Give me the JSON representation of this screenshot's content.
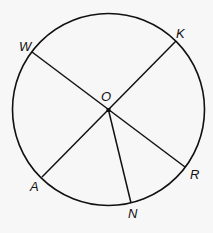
{
  "diagram": {
    "type": "circle-with-radii",
    "center": {
      "label": "O",
      "x": 108.5,
      "y": 110
    },
    "radius": 96,
    "stroke_color": "#111111",
    "background": "#f7f7f7",
    "points": [
      {
        "label": "W",
        "x": 32,
        "y": 52,
        "label_x": 20,
        "label_y": 50
      },
      {
        "label": "K",
        "x": 176,
        "y": 41,
        "label_x": 177,
        "label_y": 38
      },
      {
        "label": "R",
        "x": 185,
        "y": 167,
        "label_x": 190,
        "label_y": 179
      },
      {
        "label": "N",
        "x": 131,
        "y": 203,
        "label_x": 127,
        "label_y": 218
      },
      {
        "label": "A",
        "x": 42,
        "y": 177,
        "label_x": 30,
        "label_y": 191
      }
    ],
    "segments": [
      {
        "name": "diameter-WR",
        "from": "W",
        "to": "R"
      },
      {
        "name": "diameter-KA",
        "from": "K",
        "to": "A"
      },
      {
        "name": "radius-ON",
        "from": "O",
        "to": "N"
      }
    ],
    "center_label": {
      "text": "O",
      "x": 101,
      "y": 101
    }
  }
}
